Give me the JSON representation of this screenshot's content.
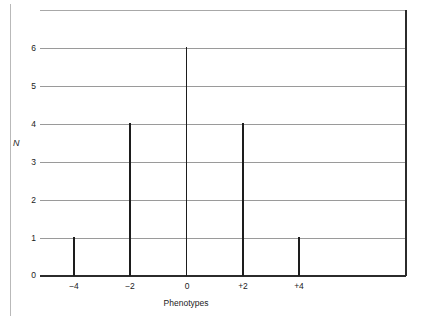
{
  "chart_data": {
    "type": "bar",
    "title": "",
    "subtitle": "",
    "xlabel": "Phenotypes",
    "ylabel": "N",
    "categories": [
      "-4",
      "-2",
      "0",
      "+2",
      "+4"
    ],
    "x": [
      -4,
      -2,
      0,
      2,
      4
    ],
    "values": [
      1,
      4,
      6,
      4,
      1
    ],
    "series": [
      {
        "name": "N",
        "values": [
          1,
          4,
          6,
          4,
          1
        ]
      }
    ],
    "xtick_labels": [
      "−4",
      "−2",
      "0",
      "+2",
      "+4"
    ],
    "ytick_labels": [
      "0",
      "1",
      "2",
      "3",
      "4",
      "5",
      "6"
    ],
    "ytick_values": [
      0,
      1,
      2,
      3,
      4,
      5,
      6
    ],
    "ylim": [
      0,
      7
    ],
    "xlim": [
      -5.3,
      6.2
    ],
    "grid": "horizontal",
    "legend": "none",
    "bar_style": "thin-vertical-line",
    "colors": {
      "bar": "#1d1d1d",
      "gridline": "#9a9a9a",
      "axis": "#2b2b2b",
      "background": "#ffffff",
      "text": "#1b1b1b"
    },
    "annotations": []
  }
}
